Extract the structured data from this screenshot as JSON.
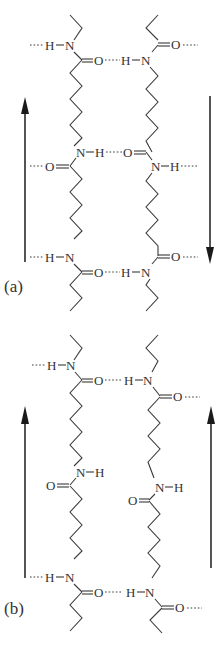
{
  "figure": {
    "panels": [
      {
        "label": "(a)",
        "arrangement": "antiparallel",
        "arrows": [
          {
            "side": "left",
            "direction": "up"
          },
          {
            "side": "right",
            "direction": "down"
          }
        ],
        "atoms": {
          "H": "H",
          "N": "N",
          "O": "O"
        }
      },
      {
        "label": "(b)",
        "arrangement": "parallel",
        "arrows": [
          {
            "side": "left",
            "direction": "up"
          },
          {
            "side": "right",
            "direction": "up"
          }
        ],
        "atoms": {
          "H": "H",
          "N": "N",
          "O": "O"
        }
      }
    ],
    "colors": {
      "ink": "#333333",
      "background": "#ffffff"
    }
  }
}
